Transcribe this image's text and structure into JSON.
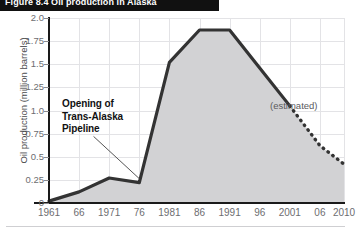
{
  "figure": {
    "title": "Figure 8.4  Oil production in Alaska",
    "bottom_rule": true
  },
  "annotations": {
    "pipeline": "Opening of\nTrans-Alaska\nPipeline",
    "estimated": "(estimated)"
  },
  "colors": {
    "line": "#333333",
    "fill": "#d2d2d4",
    "grid": "#e3e3e6",
    "axis": "#1a1a1a",
    "tick_label": "#6d6d70",
    "title_bar": "#111111",
    "title_text": "#ffffff"
  },
  "chart_data": {
    "type": "area",
    "title": "Figure 8.4  Oil production in Alaska",
    "xlabel": "",
    "ylabel": "Oil production (million barrels)",
    "xlim": [
      1961,
      2010
    ],
    "ylim": [
      0,
      2.0
    ],
    "grid": true,
    "legend_position": "none",
    "x_tick_labels": [
      "1961",
      "66",
      "1971",
      "76",
      "1981",
      "86",
      "1991",
      "96",
      "2001",
      "06",
      "2010"
    ],
    "x_tick_values": [
      1961,
      1966,
      1971,
      1976,
      1981,
      1986,
      1991,
      1996,
      2001,
      2006,
      2010
    ],
    "y_tick_labels": [
      "2.0",
      "1.75",
      "1.5",
      "1.25",
      "1.0",
      "0.75",
      "0.5",
      "0.25",
      "0"
    ],
    "y_tick_values": [
      2.0,
      1.75,
      1.5,
      1.25,
      1.0,
      0.75,
      0.5,
      0.25,
      0
    ],
    "series": [
      {
        "name": "Oil production (actual)",
        "style": "solid",
        "x": [
          1961,
          1966,
          1971,
          1976,
          1981,
          1986,
          1991,
          1996,
          2001
        ],
        "values": [
          0.02,
          0.12,
          0.27,
          0.22,
          1.52,
          1.87,
          1.87,
          1.46,
          1.05
        ]
      },
      {
        "name": "Oil production (estimated)",
        "style": "dashed",
        "x": [
          2001,
          2006,
          2010
        ],
        "values": [
          1.05,
          0.62,
          0.42
        ]
      }
    ]
  }
}
